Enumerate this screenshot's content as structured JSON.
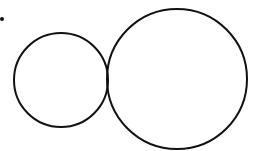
{
  "diagram": {
    "stroke_color": "#111111",
    "background": "#ffffff",
    "dot": {
      "cx": 2,
      "cy": 19,
      "r": 2
    },
    "small_circle": {
      "cx": 61,
      "cy": 80,
      "r": 47
    },
    "large_circle": {
      "cx": 177,
      "cy": 79,
      "r": 70
    }
  }
}
